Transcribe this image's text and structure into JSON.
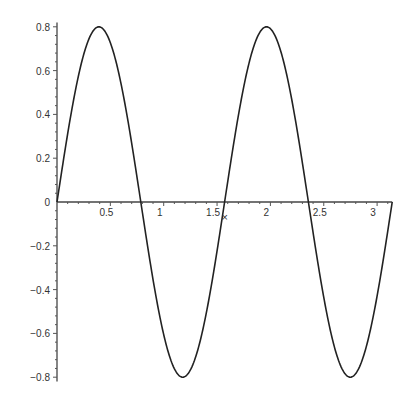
{
  "chart_data": {
    "type": "line",
    "title": "",
    "xlabel": "",
    "ylabel": "",
    "function": "0.8*sin(4x)",
    "xlim": [
      0,
      3.14159
    ],
    "ylim": [
      -0.8,
      0.8
    ],
    "grid": false,
    "legend": null,
    "x_ticks": [
      "0.5",
      "1",
      "1.5",
      "2",
      "2.5",
      "3"
    ],
    "y_ticks": [
      "0.8",
      "0.6",
      "0.4",
      "0.2",
      "0",
      "-0.2",
      "-0.4",
      "-0.6",
      "-0.8"
    ],
    "series": [
      {
        "name": "curve",
        "x": [
          0,
          0.3927,
          0.7854,
          1.1781,
          1.5708,
          1.9635,
          2.3562,
          2.7489,
          3.1416
        ],
        "y": [
          0,
          0.8,
          0,
          -0.8,
          0,
          0.8,
          0,
          -0.8,
          0
        ]
      }
    ],
    "annotations": [
      {
        "x": 1.58,
        "y": -0.07,
        "text": "×"
      }
    ],
    "line_color": "#222222"
  }
}
